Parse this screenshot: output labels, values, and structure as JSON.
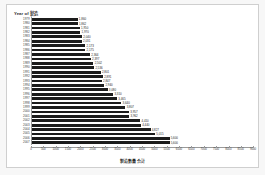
{
  "chart_data": {
    "type": "bar",
    "orientation": "horizontal",
    "title": "Year of 製造",
    "xlabel": "製造數量合計",
    "ylabel": "",
    "grid": false,
    "legend": null,
    "xlim": [
      0,
      9000
    ],
    "xticks": [
      0,
      500,
      1000,
      1500,
      2000,
      2500,
      3000,
      3500,
      4000,
      4500,
      5000,
      5500,
      6000,
      6500,
      7000,
      7500,
      8000,
      8500,
      9000
    ],
    "xtick_labels": [
      "0",
      "500",
      "1000",
      "1500",
      "2000",
      "2500",
      "3000",
      "3500",
      "4000",
      "4500",
      "5000",
      "5500",
      "6000",
      "6500",
      "7000",
      "7500",
      "8000",
      "8500",
      "9000"
    ],
    "categories": [
      "1979",
      "1980",
      "1981",
      "1982",
      "1983",
      "1984",
      "1985",
      "1986",
      "1987",
      "1988",
      "1989",
      "1990",
      "1991",
      "1992",
      "1993",
      "1994",
      "1995",
      "1996",
      "1997",
      "1998",
      "1999",
      "2000",
      "2001",
      "2002",
      "2003",
      "2004",
      "2005",
      "2006",
      "2007"
    ],
    "values": [
      1860,
      1862,
      1950,
      1970,
      2040,
      2031,
      2173,
      2175,
      2364,
      2397,
      2502,
      2536,
      2801,
      2891,
      2847,
      2940,
      3080,
      3310,
      3465,
      3640,
      3807,
      3957,
      3962,
      4410,
      4440,
      4827,
      5015,
      5600,
      5600
    ],
    "value_labels": [
      "1,860",
      "1,862",
      "1,950",
      "1,970",
      "2,040",
      "2,031",
      "2,173",
      "2,175",
      "2,364",
      "2,397",
      "2,502",
      "2,536",
      "2,801",
      "2,891",
      "2,847",
      "2,940",
      "3,080",
      "3,310",
      "3,465",
      "3,640",
      "3,807",
      "3,957",
      "3,962",
      "4,410",
      "4,440",
      "4,827",
      "5,015",
      "5,600",
      "5,600"
    ],
    "bar_color": "#1c1c1c"
  }
}
